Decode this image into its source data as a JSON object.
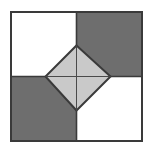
{
  "figure": {
    "name": "checkerboard-square-with-inscribed-diamond",
    "type": "geometry-diagram",
    "canvas": {
      "width": 152,
      "height": 153,
      "background": "#ffffff"
    },
    "colors": {
      "background": "#ffffff",
      "tile_light": "#ffffff",
      "tile_dark": "#6e6e6e",
      "diamond_fill": "#c9c9c9",
      "stroke": "#3a3a3a",
      "stroke_inner": "#4a4a4a"
    },
    "outer_square": {
      "label": "outer-square",
      "x": 11,
      "y": 12,
      "width": 131,
      "height": 129,
      "stroke_width": 2
    },
    "center": {
      "x": 76.5,
      "y": 76.5
    },
    "quadrants": [
      {
        "label": "top-left-tile",
        "fill": "#ffffff",
        "x": 11,
        "y": 12,
        "width": 65.5,
        "height": 64.5
      },
      {
        "label": "top-right-tile",
        "fill": "#6e6e6e",
        "x": 76.5,
        "y": 12,
        "width": 65.5,
        "height": 64.5
      },
      {
        "label": "bottom-left-tile",
        "fill": "#6e6e6e",
        "x": 11,
        "y": 76.5,
        "width": 65.5,
        "height": 64.5
      },
      {
        "label": "bottom-right-tile",
        "fill": "#ffffff",
        "x": 76.5,
        "y": 76.5,
        "width": 65.5,
        "height": 64.5
      }
    ],
    "diamond": {
      "label": "inscribed-diamond",
      "fill": "#c9c9c9",
      "stroke_width": 2,
      "vertices": [
        {
          "name": "top",
          "x": 76.5,
          "y": 45.5
        },
        {
          "name": "right",
          "x": 110.5,
          "y": 76.5
        },
        {
          "name": "bottom",
          "x": 76.5,
          "y": 110.5
        },
        {
          "name": "left",
          "x": 45.5,
          "y": 76.5
        }
      ],
      "half_width": 33,
      "half_height": 32
    },
    "diagonals": [
      {
        "label": "vertical-axis",
        "x1": 76.5,
        "y1": 45.5,
        "x2": 76.5,
        "y2": 110.5,
        "stroke_width": 1
      },
      {
        "label": "horizontal-axis",
        "x1": 45.5,
        "y1": 76.5,
        "x2": 110.5,
        "y2": 76.5,
        "stroke_width": 1
      }
    ],
    "labels": [],
    "annotations": []
  }
}
